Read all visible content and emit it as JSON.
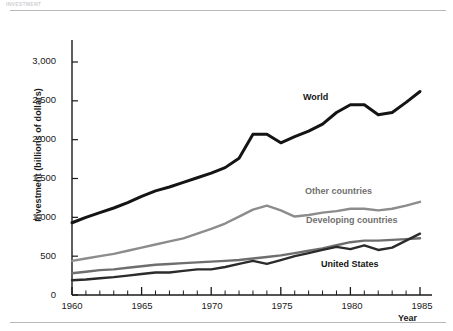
{
  "figure": {
    "caption_strip": "INVESTMENT",
    "ylabel": "Investment (billions of dollars)",
    "xlabel": "Year"
  },
  "axes": {
    "y_ticks": [
      "0",
      "500",
      "1,000",
      "1,500",
      "2,000",
      "2,500",
      "3,000"
    ],
    "x_ticks": [
      "1960",
      "1965",
      "1970",
      "1975",
      "1980",
      "1985"
    ]
  },
  "labels": {
    "world": "World",
    "other_countries": "Other countries",
    "developing_countries": "Developing countries",
    "united_states": "United States"
  },
  "colors": {
    "world": "#141414",
    "other_countries": "#8c8c8c",
    "developing_countries": "#6e6e6e",
    "united_states": "#2b2b2b",
    "axis": "#1a1a1a",
    "rule": "#b9b9bd"
  },
  "chart_data": {
    "type": "line",
    "title": "",
    "xlabel": "Year",
    "ylabel": "Investment (billions of dollars)",
    "xlim": [
      1960,
      1985
    ],
    "ylim": [
      0,
      3200
    ],
    "ytick_values": [
      0,
      500,
      1000,
      1500,
      2000,
      2500,
      3000
    ],
    "xtick_values": [
      1960,
      1965,
      1970,
      1975,
      1980,
      1985
    ],
    "minor_x_ticks": "every 1 year",
    "grid": false,
    "legend": "inline data labels",
    "x": [
      1960,
      1961,
      1962,
      1963,
      1964,
      1965,
      1966,
      1967,
      1968,
      1969,
      1970,
      1971,
      1972,
      1973,
      1974,
      1975,
      1976,
      1977,
      1978,
      1979,
      1980,
      1981,
      1982,
      1983,
      1984,
      1985
    ],
    "series": [
      {
        "name": "World",
        "color": "#141414",
        "values": [
          930,
          1000,
          1060,
          1120,
          1190,
          1270,
          1340,
          1390,
          1450,
          1510,
          1570,
          1640,
          1760,
          2070,
          2070,
          1960,
          2040,
          2110,
          2200,
          2350,
          2450,
          2450,
          2320,
          2350,
          2480,
          2620
        ]
      },
      {
        "name": "Other countries",
        "color": "#8c8c8c",
        "values": [
          440,
          470,
          500,
          530,
          570,
          610,
          650,
          690,
          730,
          790,
          850,
          920,
          1010,
          1100,
          1150,
          1090,
          1010,
          1030,
          1060,
          1080,
          1110,
          1110,
          1090,
          1110,
          1150,
          1200
        ]
      },
      {
        "name": "Developing countries",
        "color": "#6e6e6e",
        "values": [
          280,
          300,
          320,
          330,
          350,
          370,
          390,
          400,
          410,
          420,
          430,
          440,
          450,
          470,
          490,
          510,
          540,
          570,
          600,
          640,
          680,
          700,
          700,
          710,
          720,
          730
        ]
      },
      {
        "name": "United States",
        "color": "#2b2b2b",
        "values": [
          190,
          200,
          215,
          230,
          250,
          270,
          290,
          290,
          310,
          330,
          330,
          360,
          400,
          440,
          400,
          450,
          500,
          540,
          580,
          620,
          590,
          640,
          580,
          610,
          700,
          790
        ]
      }
    ]
  }
}
